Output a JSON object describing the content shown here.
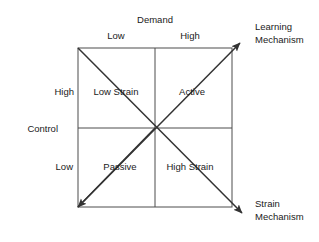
{
  "diagram": {
    "axes": {
      "x": {
        "name": "Demand",
        "low_label": "Low",
        "high_label": "High"
      },
      "y": {
        "name": "Control",
        "high_label": "High",
        "low_label": "Low"
      }
    },
    "quadrants": [
      {
        "id": "low-strain",
        "label": "Low Strain",
        "demand": "Low",
        "control": "High"
      },
      {
        "id": "active",
        "label": "Active",
        "demand": "High",
        "control": "High"
      },
      {
        "id": "passive",
        "label": "Passive",
        "demand": "Low",
        "control": "Low"
      },
      {
        "id": "high-strain",
        "label": "High Strain",
        "demand": "High",
        "control": "Low"
      }
    ],
    "diagonals": [
      {
        "id": "learning-mechanism",
        "line1": "Learning",
        "line2": "Mechanism",
        "from": "Passive",
        "to": "Active"
      },
      {
        "id": "strain-mechanism",
        "line1": "Strain",
        "line2": "Mechanism",
        "from": "Low Strain",
        "to": "High Strain"
      }
    ],
    "colors": {
      "line": "#4d4d4d",
      "arrow": "#333333",
      "text": "#1a1a1a",
      "background": "#ffffff"
    }
  }
}
